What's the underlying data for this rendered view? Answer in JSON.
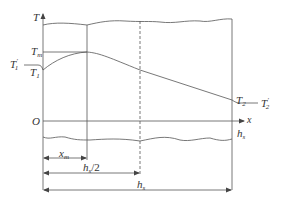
{
  "diagram": {
    "type": "temperature distribution along slab thickness",
    "axes": {
      "y_axis_label": "T",
      "x_axis_label": "x",
      "origin_label": "O"
    },
    "curve_labels": {
      "t_max": {
        "base": "T",
        "sub": "m"
      },
      "t1_prime": {
        "base": "T",
        "sub": "1",
        "sup": "′"
      },
      "t1": {
        "base": "T",
        "sub": "1"
      },
      "t2": {
        "base": "T",
        "sub": "2"
      },
      "t2_prime": {
        "base": "T",
        "sub": "2",
        "sup": "′"
      }
    },
    "boundary_label": {
      "base": "h",
      "sub": "s"
    },
    "dimensions": {
      "x_m": {
        "base": "x",
        "sub": "m"
      },
      "half_thickness": {
        "base": "h",
        "sub": "s",
        "suffix": "/2"
      },
      "thickness": {
        "base": "h",
        "sub": "s"
      }
    },
    "colors": {
      "line": "#555555",
      "text": "#333333"
    }
  }
}
